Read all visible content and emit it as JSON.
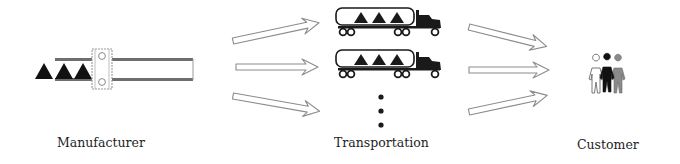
{
  "diagram": {
    "type": "supply-chain-flow",
    "stages": [
      {
        "id": "manufacturer",
        "label": "Manufacturer",
        "icon": "conveyor-belt-icon"
      },
      {
        "id": "transportation",
        "label": "Transportation",
        "icon": "tanker-truck-icon"
      },
      {
        "id": "customer",
        "label": "Customer",
        "icon": "people-group-icon"
      }
    ],
    "manufacturer": {
      "product_count": 3,
      "product_shape": "triangle"
    },
    "transportation": {
      "visible_trucks": 2,
      "trucks_cargo_per_truck": 3,
      "continuation": "vertical-ellipsis"
    },
    "customer": {
      "figures": 3,
      "figure_colors": [
        "#ffffff",
        "#111111",
        "#8a8a8a"
      ]
    },
    "arrows": {
      "manufacturer_to_transportation": 3,
      "transportation_to_customer": 3
    },
    "colors": {
      "ink": "#1a1a1a",
      "arrow_stroke": "#8c8c8c",
      "rail": "#6e6e6e",
      "background": "#ffffff"
    }
  }
}
